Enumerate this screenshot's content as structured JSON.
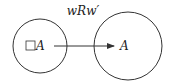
{
  "diagram": {
    "type": "kripke-frame",
    "relation_label": "wRw′",
    "worlds": [
      {
        "id": "w",
        "formula_operator": "box-icon",
        "formula_text": "A",
        "cx": 40,
        "cy": 46,
        "r": 27
      },
      {
        "id": "w_prime",
        "formula_text": "A",
        "cx": 128,
        "cy": 46,
        "r": 34
      }
    ],
    "edges": [
      {
        "from": "w",
        "to": "w_prime",
        "directed": true
      }
    ],
    "colors": {
      "stroke": "#333333",
      "text": "#222222",
      "background": "#ffffff"
    }
  }
}
